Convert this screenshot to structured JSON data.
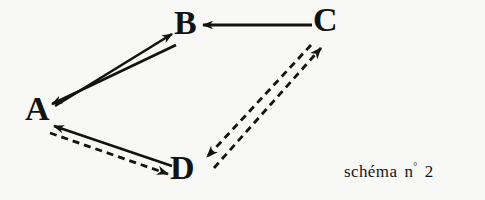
{
  "figure": {
    "caption_word": "schéma",
    "caption_ordinal_prefix": "n",
    "caption_ordinal_mark": "°",
    "caption_number": "2",
    "background_color": "#f8f8f6",
    "ink_color": "#121210"
  },
  "nodes": [
    {
      "id": "A",
      "label": "A",
      "x": 38,
      "y": 110
    },
    {
      "id": "B",
      "label": "B",
      "x": 186,
      "y": 24
    },
    {
      "id": "C",
      "label": "C",
      "x": 327,
      "y": 22
    },
    {
      "id": "D",
      "label": "D",
      "x": 183,
      "y": 169
    }
  ],
  "edges": [
    {
      "id": "a-to-b",
      "from": "A",
      "to": "B",
      "style": "solid",
      "arrowhead": "B",
      "label": ""
    },
    {
      "id": "b-to-a",
      "from": "B",
      "to": "A",
      "style": "solid",
      "arrowhead": "A",
      "label": ""
    },
    {
      "id": "c-to-b",
      "from": "C",
      "to": "B",
      "style": "solid",
      "arrowhead": "B",
      "label": ""
    },
    {
      "id": "d-to-a",
      "from": "D",
      "to": "A",
      "style": "solid",
      "arrowhead": "A",
      "label": ""
    },
    {
      "id": "a-to-d",
      "from": "A",
      "to": "D",
      "style": "dashed",
      "arrowhead": "D",
      "label": ""
    },
    {
      "id": "c-to-d",
      "from": "C",
      "to": "D",
      "style": "dashed",
      "arrowhead": "D",
      "label": ""
    },
    {
      "id": "d-to-c",
      "from": "D",
      "to": "C",
      "style": "dashed",
      "arrowhead": "C",
      "label": ""
    }
  ]
}
